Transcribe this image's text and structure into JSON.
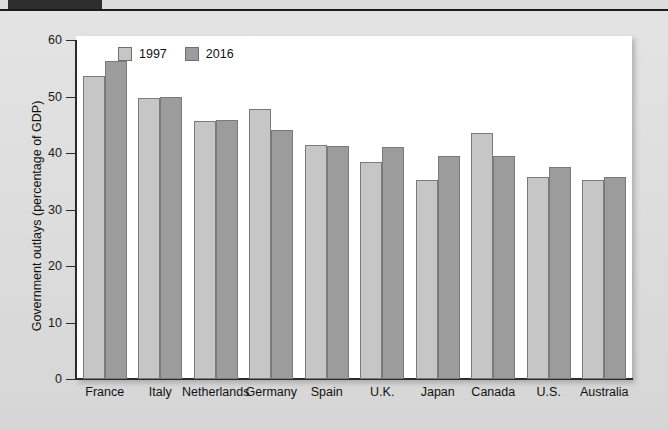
{
  "header": {
    "tab_label": ""
  },
  "chart_data": {
    "type": "bar",
    "title": "",
    "xlabel": "",
    "ylabel": "Government outlays (percentage of GDP)",
    "ylim": [
      0,
      60
    ],
    "yticks": [
      0,
      10,
      20,
      30,
      40,
      50,
      60
    ],
    "ytick_labels": [
      "0",
      "10",
      "20",
      "30",
      "40",
      "50",
      "60"
    ],
    "grid": false,
    "legend_position": "top-left-inside",
    "categories": [
      "France",
      "Italy",
      "Netherlands",
      "Germany",
      "Spain",
      "U.K.",
      "Japan",
      "Canada",
      "U.S.",
      "Australia"
    ],
    "series": [
      {
        "name": "1997",
        "color": "#c6c6c6",
        "values": [
          53.7,
          49.8,
          45.6,
          47.8,
          41.5,
          38.4,
          35.3,
          43.5,
          35.8,
          35.3
        ]
      },
      {
        "name": "2016",
        "color": "#9c9c9c",
        "values": [
          56.2,
          50.0,
          45.9,
          44.1,
          41.2,
          41.0,
          39.5,
          39.4,
          37.6,
          35.7
        ]
      }
    ]
  }
}
